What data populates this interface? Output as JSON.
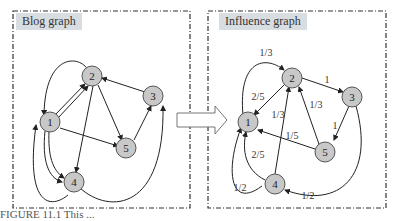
{
  "left_panel": {
    "title": "Blog graph",
    "nodes": [
      "1",
      "2",
      "3",
      "4",
      "5"
    ]
  },
  "right_panel": {
    "title": "Influence graph",
    "nodes": [
      "1",
      "2",
      "3",
      "4",
      "5"
    ],
    "edge_labels": {
      "e4_2_top": "1/3",
      "e2_1": "2/5",
      "e2_3": "1",
      "e5_2": "1/3",
      "e4_2": "1/3",
      "e3_5": "1",
      "e5_1": "1/5",
      "e4_1": "2/5",
      "e1_4": "1/2",
      "e3_4": "1/2"
    }
  },
  "caption": "FIGURE 11.1   This ..."
}
